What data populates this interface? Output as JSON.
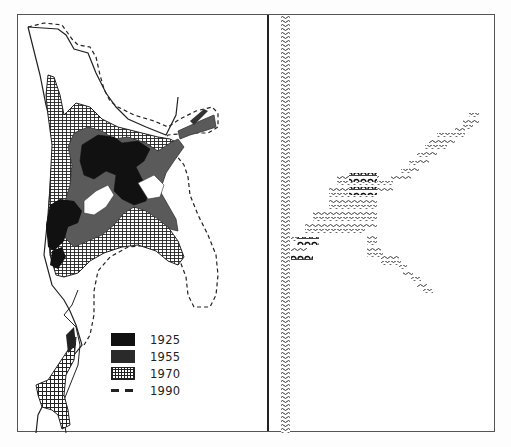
{
  "figure": {
    "left_panel": {
      "type": "map",
      "description": "urban growth map with coastline and growth stages",
      "legend": [
        {
          "label": "1925",
          "pattern": "solid-black",
          "color": "#111111"
        },
        {
          "label": "1955",
          "pattern": "solid-dark-gray",
          "color": "#555555"
        },
        {
          "label": "1970",
          "pattern": "crosshatch-grid",
          "color": "#333333"
        },
        {
          "label": "1990",
          "pattern": "dashed-line",
          "color": "#222222"
        }
      ]
    },
    "right_panel": {
      "type": "schematic",
      "description": "schematic of coastline with wave symbols and settlement arcs"
    },
    "colors": {
      "ink": "#1a1a1a",
      "frame": "#555555",
      "background": "#ffffff"
    }
  }
}
